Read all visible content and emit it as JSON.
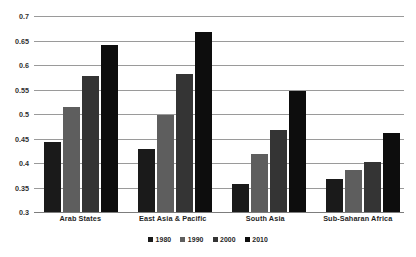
{
  "chart_data": {
    "type": "bar",
    "title": "",
    "subtitle": "",
    "xlabel": "",
    "ylabel": "",
    "ylim": [
      0.3,
      0.7
    ],
    "ytick_step": 0.05,
    "yticks": [
      "0.7",
      "0.65",
      "0.6",
      "0.55",
      "0.5",
      "0.45",
      "0.4",
      "0.35",
      "0.3"
    ],
    "ytick_values": [
      0.7,
      0.65,
      0.6,
      0.55,
      0.5,
      0.45,
      0.4,
      0.35,
      0.3
    ],
    "grid": true,
    "grid_axis": "y",
    "legend_position": "bottom",
    "categories": [
      "Arab States",
      "East Asia & Pacific",
      "South Asia",
      "Sub-Saharan Africa"
    ],
    "series": [
      {
        "name": "1980",
        "color": "#1a1a1a",
        "values": [
          0.443,
          0.428,
          0.357,
          0.367
        ]
      },
      {
        "name": "1990",
        "color": "#5e5e5e",
        "values": [
          0.515,
          0.499,
          0.419,
          0.385
        ]
      },
      {
        "name": "2000",
        "color": "#343434",
        "values": [
          0.578,
          0.582,
          0.468,
          0.402
        ]
      },
      {
        "name": "2010",
        "color": "#0d0d0d",
        "values": [
          0.64,
          0.667,
          0.547,
          0.461
        ]
      }
    ]
  },
  "style": {
    "background": "#ffffff",
    "gridline_color": "#9a9a9a",
    "axis_color": "#7d7d7d",
    "text_color": "#1f1f1f"
  }
}
